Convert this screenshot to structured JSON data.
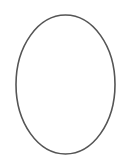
{
  "canvas": {
    "width": 120,
    "height": 168,
    "background": "#ffffff"
  },
  "shapes": [
    {
      "type": "ellipse",
      "cx": 65.5,
      "cy": 84.5,
      "rx": 49.5,
      "ry": 69.5,
      "stroke": "#555555",
      "stroke_width": 1.6,
      "fill": "none"
    }
  ]
}
